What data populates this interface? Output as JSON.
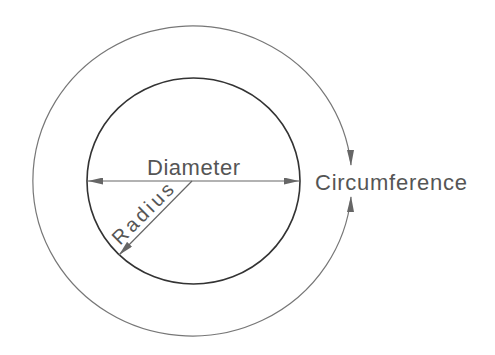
{
  "diagram": {
    "labels": {
      "diameter": "Diameter",
      "radius": "Radius",
      "circumference": "Circumference"
    },
    "colors": {
      "outer_circle": "#777777",
      "inner_circle": "#333333",
      "lines": "#666666",
      "text": "#555555"
    }
  }
}
